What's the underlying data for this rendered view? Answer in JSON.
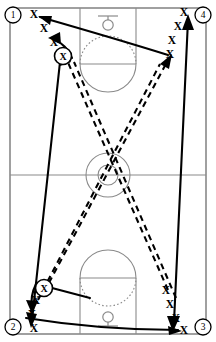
{
  "diagram": {
    "type": "basketball-court-full",
    "width": 216,
    "height": 342,
    "colors": {
      "court_line": "#8a8a8a",
      "path": "#000000",
      "background": "#ffffff",
      "border": "#6e6e6e"
    }
  },
  "court": {
    "boundary": {
      "x": 10,
      "y": 8,
      "width": 196,
      "height": 326
    },
    "midcourt_line_y": 175,
    "center_circle_outer_r": 22,
    "center_circle_inner_r": 10,
    "center_x": 108,
    "top_key": {
      "lane_x": 80,
      "lane_width": 56,
      "lane_top": 8,
      "lane_bottom": 64,
      "arc_r": 28,
      "hoop_y": 22
    },
    "bottom_key": {
      "lane_x": 80,
      "lane_width": 56,
      "lane_top": 278,
      "lane_bottom": 334,
      "arc_r": 28,
      "hoop_y": 320
    }
  },
  "positions": [
    {
      "id": "corner-1",
      "label": "1",
      "x": 13,
      "y": 15
    },
    {
      "id": "corner-4",
      "label": "4",
      "x": 203,
      "y": 15
    },
    {
      "id": "corner-2",
      "label": "2",
      "x": 13,
      "y": 327
    },
    {
      "id": "corner-3",
      "label": "3",
      "x": 203,
      "y": 327
    }
  ],
  "players": {
    "ball_handler_label": "X",
    "queue_label": "X",
    "top_left_queue": [
      {
        "x": 34,
        "y": 14
      },
      {
        "x": 44,
        "y": 28
      },
      {
        "x": 54,
        "y": 42
      }
    ],
    "top_left_active": {
      "x": 63,
      "y": 56,
      "label": "X"
    },
    "top_right_queue": [
      {
        "x": 184,
        "y": 12
      },
      {
        "x": 178,
        "y": 26
      },
      {
        "x": 172,
        "y": 40
      },
      {
        "x": 170,
        "y": 54
      }
    ],
    "bottom_left_queue": [
      {
        "x": 34,
        "y": 328
      },
      {
        "x": 32,
        "y": 314
      },
      {
        "x": 36,
        "y": 300
      }
    ],
    "bottom_left_active": {
      "x": 44,
      "y": 288,
      "label": "X"
    },
    "bottom_right_queue": [
      {
        "x": 184,
        "y": 330
      },
      {
        "x": 176,
        "y": 318
      },
      {
        "x": 170,
        "y": 304
      },
      {
        "x": 166,
        "y": 290
      }
    ]
  },
  "movements": [
    {
      "id": "pass-top",
      "style": "solid",
      "description": "Pass from right wing to position 1 corner",
      "arrow": "left"
    },
    {
      "id": "pass-bottom",
      "style": "solid",
      "description": "Pass from position 2 corner to bottom right",
      "arrow": "right"
    },
    {
      "id": "run-left-sideline",
      "style": "solid",
      "description": "Player runs down left sideline from top to bottom"
    },
    {
      "id": "run-right-sideline",
      "style": "solid",
      "description": "Player runs down right sideline from top to bottom"
    },
    {
      "id": "cut-diagonal-a",
      "style": "dashed",
      "description": "Diagonal cut from bottom left to top right through center"
    },
    {
      "id": "cut-diagonal-b",
      "style": "dashed",
      "description": "Diagonal cut from bottom right to top left through center"
    }
  ],
  "legend": {
    "solid_meaning": "pass / run",
    "dashed_meaning": "cut"
  }
}
